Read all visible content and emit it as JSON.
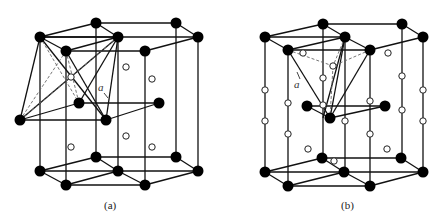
{
  "figure": {
    "panels": [
      {
        "id": "a",
        "caption": "(a)",
        "lattice_label": "a",
        "description": "HCP lattice with octahedral interstitial sites"
      },
      {
        "id": "b",
        "caption": "(b)",
        "lattice_label": "a",
        "description": "HCP lattice with tetrahedral interstitial sites"
      }
    ]
  },
  "legend": {
    "filled_circle": "lattice atom",
    "open_circle": "interstitial site"
  },
  "colors": {
    "atom": "#000000",
    "line": "#111111",
    "dash": "#666666",
    "background": "#ffffff"
  }
}
